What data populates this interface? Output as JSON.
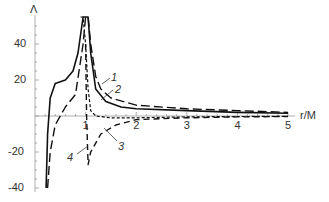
{
  "chart_data": {
    "type": "line",
    "title": "",
    "xlabel": "r/M",
    "ylabel": "Λ",
    "xlim": [
      0,
      5
    ],
    "ylim": [
      -40,
      55
    ],
    "grid": false,
    "legend": "inline numbered annotations 1-4",
    "x_ticks": [
      "1",
      "2",
      "3",
      "4",
      "5"
    ],
    "y_ticks": [
      "40",
      "20",
      "-20",
      "-40"
    ],
    "annotations": [
      {
        "label": "1",
        "points_to": "curve 1 (long dash) near r/M≈1.3"
      },
      {
        "label": "2",
        "points_to": "curve 2 (solid) near r/M≈1.2"
      },
      {
        "label": "2",
        "points_to": "curve 2 at r/M≈2 below axis"
      },
      {
        "label": "3",
        "points_to": "curve 3 (short dash) near r/M≈1.3"
      },
      {
        "label": "3",
        "points_to": "x-axis near r/M≈3"
      },
      {
        "label": "4",
        "points_to": "curve 4 (dash) minimum near r/M≈1.0, Λ≈-27"
      }
    ],
    "series": [
      {
        "name": "1",
        "style": "long-dash",
        "x": [
          0.25,
          0.3,
          0.4,
          0.6,
          0.8,
          0.95,
          1.0,
          1.05,
          1.1,
          1.2,
          1.3,
          1.5,
          2.0,
          3.0,
          4.0,
          5.0
        ],
        "y": [
          -40,
          -20,
          -5,
          5,
          12,
          40,
          55,
          55,
          40,
          22,
          15,
          10,
          6,
          4,
          3,
          2
        ]
      },
      {
        "name": "2",
        "style": "solid",
        "x": [
          0.22,
          0.25,
          0.3,
          0.4,
          0.6,
          0.75,
          0.85,
          0.95,
          1.0,
          1.05,
          1.1,
          1.2,
          1.4,
          1.7,
          2.0,
          3.0,
          4.0,
          5.0
        ],
        "y": [
          -40,
          -10,
          10,
          18,
          20,
          25,
          35,
          55,
          55,
          55,
          35,
          15,
          8,
          5,
          4,
          3,
          2,
          1.5
        ]
      },
      {
        "name": "3",
        "style": "short-dash",
        "x": [
          0.9,
          0.95,
          1.0,
          1.05,
          1.1,
          1.2,
          1.5,
          2.0,
          3.0,
          4.0,
          5.0
        ],
        "y": [
          55,
          55,
          40,
          15,
          3,
          0,
          -1,
          -1,
          -0.5,
          -0.3,
          -0.2
        ]
      },
      {
        "name": "4",
        "style": "dash",
        "x": [
          1.0,
          1.02,
          1.05,
          1.1,
          1.3,
          1.6,
          2.0,
          3.0,
          4.0,
          5.0
        ],
        "y": [
          40,
          0,
          -27,
          -20,
          -10,
          -5,
          -2,
          -1,
          -0.5,
          -0.3
        ]
      }
    ]
  }
}
